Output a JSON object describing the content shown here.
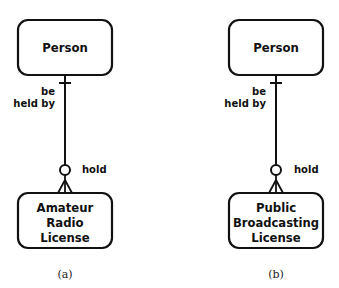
{
  "diagrams": [
    {
      "top_entity": "Person",
      "bottom_entity_lines": [
        "Amateur",
        "Radio",
        "License"
      ],
      "top_role": [
        "be",
        "held by"
      ],
      "bottom_role": "hold",
      "caption": "(a)"
    },
    {
      "top_entity": "Person",
      "bottom_entity_lines": [
        "Public",
        "Broadcasting",
        "License"
      ],
      "top_role": [
        "be",
        "held by"
      ],
      "bottom_role": "hold",
      "caption": "(b)"
    }
  ],
  "colors": {
    "line": "#111111",
    "background": "#ffffff"
  }
}
